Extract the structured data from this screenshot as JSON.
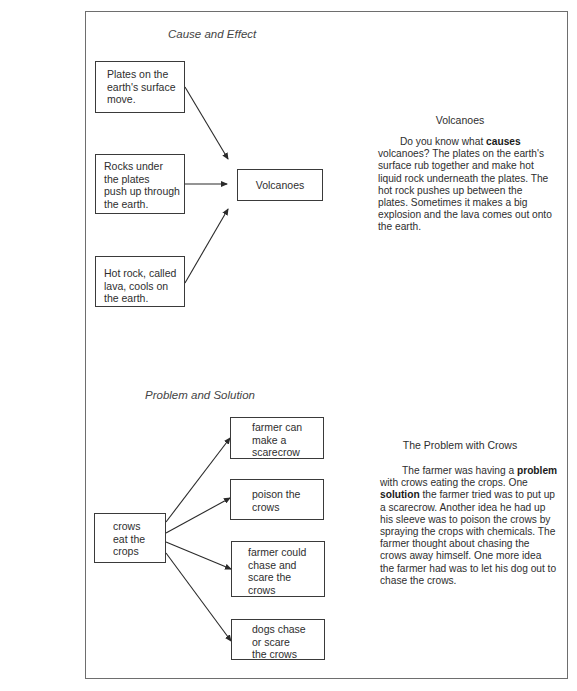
{
  "cause_effect": {
    "title": "Cause and Effect",
    "causes": [
      {
        "text": "Plates on the\nearth's surface\nmove."
      },
      {
        "text": "Rocks under\nthe plates\npush up through\nthe earth."
      },
      {
        "text": "Hot rock, called\nlava, cools on\nthe earth."
      }
    ],
    "effect": {
      "text": "Volcanoes"
    },
    "article": {
      "heading": "Volcanoes",
      "segments": [
        {
          "text": "Do you know what ",
          "bold": false
        },
        {
          "text": "causes",
          "bold": true
        },
        {
          "text": " volcanoes? The plates on the earth's surface rub together and make hot liquid rock underneath the plates. The hot rock pushes up between the plates. Sometimes it makes a big explosion and the lava comes out onto the earth.",
          "bold": false
        }
      ]
    }
  },
  "problem_solution": {
    "title": "Problem and Solution",
    "problem": {
      "text": "crows\neat the\ncrops"
    },
    "solutions": [
      {
        "text": "farmer can\nmake a\nscarecrow"
      },
      {
        "text": "poison the\ncrows"
      },
      {
        "text": "farmer could\nchase and\nscare the\ncrows"
      },
      {
        "text": "dogs chase\nor scare\nthe crows"
      }
    ],
    "article": {
      "heading": "The Problem with Crows",
      "segments": [
        {
          "text": "The farmer was having a ",
          "bold": false
        },
        {
          "text": "problem",
          "bold": true
        },
        {
          "text": " with crows eating the crops. One ",
          "bold": false
        },
        {
          "text": "solution",
          "bold": true
        },
        {
          "text": " the farmer tried was to put up a scarecrow. Another idea he had up his sleeve was to poison the crows by spraying the crops with chemicals. The farmer thought about chasing the crows away himself. One more idea the farmer had was to let his dog out to chase the crows.",
          "bold": false
        }
      ]
    }
  }
}
